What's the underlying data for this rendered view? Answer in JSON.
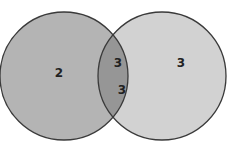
{
  "diagram": {
    "type": "venn",
    "sets": [
      {
        "name": "left-set",
        "cx": 76,
        "cy": 76,
        "r": 64,
        "fill": "#b4b4b4",
        "stroke": "#3a3a3a"
      },
      {
        "name": "right-set",
        "cx": 162,
        "cy": 76,
        "r": 64,
        "fill": "#d0d0d0",
        "stroke": "#3a3a3a"
      }
    ],
    "intersection_fill": "#969696",
    "labels": {
      "left_only": "2",
      "right_only": "3",
      "intersection_top": "3",
      "intersection_bottom": "3"
    }
  }
}
